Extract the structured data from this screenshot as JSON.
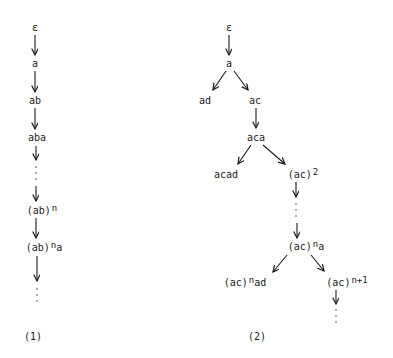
{
  "tree1": {
    "caption": "(1)",
    "nodes": [
      {
        "id": "eps",
        "text": "ε",
        "x": 35,
        "y": 28
      },
      {
        "id": "a",
        "text": "a",
        "x": 35,
        "y": 64
      },
      {
        "id": "ab",
        "text": "ab",
        "x": 35,
        "y": 101
      },
      {
        "id": "aba",
        "text": "aba",
        "x": 37,
        "y": 138
      },
      {
        "id": "abn",
        "base": "(ab)",
        "sup": "n",
        "x": 42,
        "y": 211
      },
      {
        "id": "abna",
        "base": "(ab)",
        "sup": "n",
        "tail": "a",
        "x": 44,
        "y": 248
      }
    ]
  },
  "tree2": {
    "caption": "(2)",
    "nodes": [
      {
        "id": "eps",
        "text": "ε",
        "x": 229,
        "y": 28
      },
      {
        "id": "a",
        "text": "a",
        "x": 229,
        "y": 64
      },
      {
        "id": "ad",
        "text": "ad",
        "x": 205,
        "y": 101
      },
      {
        "id": "ac",
        "text": "ac",
        "x": 255,
        "y": 101
      },
      {
        "id": "aca",
        "text": "aca",
        "x": 256,
        "y": 138
      },
      {
        "id": "acad",
        "text": "acad",
        "x": 226,
        "y": 175
      },
      {
        "id": "ac2",
        "base": "(ac)",
        "sup": "2",
        "x": 303,
        "y": 175
      },
      {
        "id": "acna",
        "base": "(ac)",
        "sup": "n",
        "tail": "a",
        "x": 306,
        "y": 247
      },
      {
        "id": "acnad",
        "base": "(ac)",
        "sup": "n",
        "tail": "ad",
        "x": 245,
        "y": 283
      },
      {
        "id": "acn1",
        "base": "(ac)",
        "sup": "n+1",
        "x": 347,
        "y": 283
      }
    ]
  }
}
